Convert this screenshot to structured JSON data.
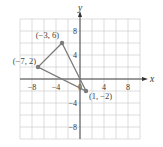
{
  "chart_data": {
    "type": "scatter",
    "title": "",
    "xlabel": "x",
    "ylabel": "y",
    "xlim": [
      -10,
      10
    ],
    "ylim": [
      -10,
      10
    ],
    "grid": true,
    "grid_step": 2,
    "x_ticks": [
      -8,
      -4,
      0,
      4,
      8
    ],
    "y_ticks": [
      8,
      4,
      -4,
      -8
    ],
    "x_tick_labels": [
      "−8",
      "−4",
      "0",
      "4",
      "8"
    ],
    "y_tick_labels": [
      "8",
      "4",
      "−4",
      "−8"
    ],
    "series": [
      {
        "name": "triangle",
        "closed": true,
        "points": [
          {
            "x": -3,
            "y": 6,
            "label": "(−3, 6)"
          },
          {
            "x": -7,
            "y": 2,
            "label": "(−7, 2)"
          },
          {
            "x": 1,
            "y": -2,
            "label": "(1, −2)"
          }
        ]
      }
    ],
    "colors": {
      "shape": "#7a7a7a",
      "grid": "#c8c8c8",
      "axis": "#333333"
    }
  }
}
